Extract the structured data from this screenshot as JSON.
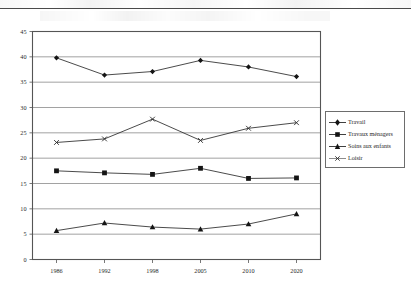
{
  "chart_data": {
    "type": "line",
    "title": "",
    "subtitle": "",
    "xlabel": "",
    "ylabel": "",
    "categories": [
      "1986",
      "1992",
      "1998",
      "2005",
      "2010",
      "2020"
    ],
    "ylim": [
      0,
      45
    ],
    "ytick_step": 5,
    "yticks": [
      "0",
      "5",
      "10",
      "15",
      "20",
      "25",
      "30",
      "35",
      "40",
      "45"
    ],
    "grid": "horizontal",
    "legend_position": "right",
    "series": [
      {
        "name": "Travail",
        "marker": "diamond",
        "values": [
          39.8,
          36.4,
          37.1,
          39.3,
          38.0,
          36.1
        ]
      },
      {
        "name": "Travaux ménagers",
        "marker": "square",
        "values": [
          17.5,
          17.1,
          16.8,
          18.0,
          16.0,
          16.1
        ]
      },
      {
        "name": "Soins aux enfants",
        "marker": "triangle",
        "values": [
          5.7,
          7.2,
          6.4,
          6.0,
          7.0,
          9.0
        ]
      },
      {
        "name": "Loisir",
        "marker": "cross",
        "values": [
          23.1,
          23.8,
          27.7,
          23.5,
          25.9,
          27.0
        ]
      }
    ]
  },
  "legend": {
    "entries": [
      {
        "label": "Travail",
        "marker": "diamond"
      },
      {
        "label": "Travaux ménagers",
        "marker": "square"
      },
      {
        "label": "Soins aux enfants",
        "marker": "triangle"
      },
      {
        "label": "Loisir",
        "marker": "cross"
      }
    ]
  },
  "colors": {
    "series_line": "#2a2a2a",
    "grid": "#8a8a8a",
    "axis": "#555555",
    "text": "#1f1f1f",
    "legend_border": "#6d6d6d",
    "background": "#ffffff"
  }
}
